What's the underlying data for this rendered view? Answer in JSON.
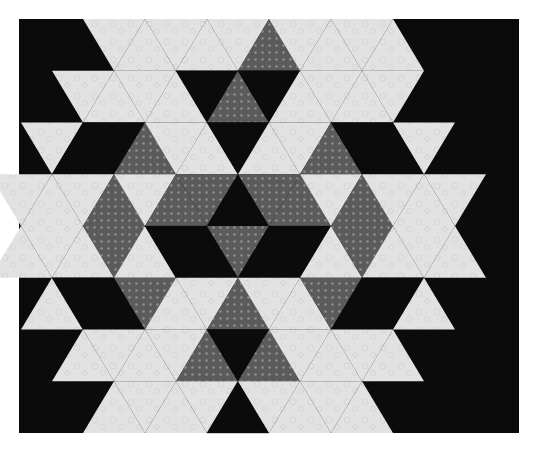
{
  "image": {
    "title": "Hexagonal star quilt block",
    "description": "Six-pointed star quilt pattern built from equilateral triangles in black, grey dotted and light floral fabrics, set inside a light hexagon on a black background"
  },
  "colors": {
    "page_background": "#ffffff",
    "black_fabric": "#0b0b0b",
    "grey_fabric": "#5b5b5b",
    "grey_dot": "#8e8e8e",
    "light_fabric": "#e2e2e2",
    "light_texture": "#d2d2d2"
  },
  "geometry": {
    "frame": {
      "x": 19,
      "y": 19,
      "width": 500,
      "height": 414
    },
    "center": {
      "x": 269,
      "y": 226
    },
    "half_step_x": 31,
    "row_height": 51.75
  },
  "bands": [
    {
      "row_top": -4,
      "row_bottom": -3,
      "start_k": -5,
      "triangles": [
        "L",
        "L",
        "L",
        "L",
        "L",
        "G",
        "L",
        "L",
        "L",
        "L"
      ]
    },
    {
      "row_top": -3,
      "row_bottom": -2,
      "start_k": -6,
      "triangles": [
        "L",
        "L",
        "L",
        "L",
        "K",
        "G",
        "K",
        "L",
        "L",
        "L",
        "L"
      ]
    },
    {
      "row_top": -2,
      "row_bottom": -1,
      "start_k": -7,
      "triangles": [
        "L",
        "K",
        "K",
        "G",
        "L",
        "L",
        "K",
        "L",
        "L",
        "G",
        "K",
        "K",
        "L"
      ]
    },
    {
      "row_top": -1,
      "row_bottom": 0,
      "start_k": -8,
      "triangles": [
        "L",
        "L",
        "L",
        "G",
        "L",
        "G",
        "G",
        "K",
        "G",
        "G",
        "L",
        "G",
        "L",
        "L",
        "L"
      ]
    },
    {
      "row_top": 0,
      "row_bottom": 1,
      "start_k": -8,
      "triangles": [
        "L",
        "L",
        "L",
        "G",
        "L",
        "K",
        "K",
        "G",
        "K",
        "K",
        "L",
        "G",
        "L",
        "L",
        "L"
      ]
    },
    {
      "row_top": 1,
      "row_bottom": 2,
      "start_k": -7,
      "triangles": [
        "L",
        "K",
        "K",
        "G",
        "L",
        "L",
        "G",
        "L",
        "L",
        "G",
        "K",
        "K",
        "L"
      ]
    },
    {
      "row_top": 2,
      "row_bottom": 3,
      "start_k": -6,
      "triangles": [
        "L",
        "L",
        "L",
        "L",
        "G",
        "K",
        "G",
        "L",
        "L",
        "L",
        "L"
      ]
    },
    {
      "row_top": 3,
      "row_bottom": 4,
      "start_k": -5,
      "triangles": [
        "L",
        "L",
        "L",
        "L",
        "K",
        "L",
        "L",
        "L",
        "L"
      ]
    }
  ]
}
